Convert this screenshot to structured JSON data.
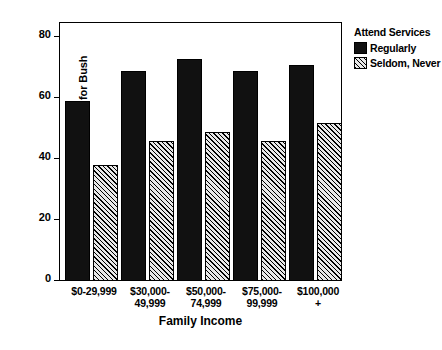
{
  "chart_data": {
    "type": "bar",
    "title": "",
    "xlabel": "Family Income",
    "ylabel": "% Voting for Bush",
    "ylim": [
      0,
      85
    ],
    "yticks": [
      0,
      20,
      40,
      60,
      80
    ],
    "ytick_labels": [
      "0",
      "20",
      "40",
      "60",
      "80"
    ],
    "grid": false,
    "legend_position": "right-top",
    "legend_title": "Attend Services",
    "categories": [
      "$0-29,999",
      "$30,000-\n49,999",
      "$50,000-\n74,999",
      "$75,000-\n99,999",
      "$100,000\n+"
    ],
    "series": [
      {
        "name": "Regularly",
        "fill": "solid-black",
        "color": "#111111",
        "values": [
          59,
          69,
          73,
          69,
          71
        ]
      },
      {
        "name": "Seldom, Never",
        "fill": "diagonal-hatch",
        "color": "#e8e8e8",
        "values": [
          38,
          46,
          49,
          46,
          52
        ]
      }
    ]
  },
  "axes": {
    "y_label": "% Voting for Bush",
    "x_label": "Family Income",
    "y_tick_0": "0",
    "y_tick_1": "20",
    "y_tick_2": "40",
    "y_tick_3": "60",
    "y_tick_4": "80",
    "x_cat_0_line_1": "$0-29,999",
    "x_cat_0_line_2": "",
    "x_cat_1_line_1": "$30,000-",
    "x_cat_1_line_2": "49,999",
    "x_cat_2_line_1": "$50,000-",
    "x_cat_2_line_2": "74,999",
    "x_cat_3_line_1": "$75,000-",
    "x_cat_3_line_2": "99,999",
    "x_cat_4_line_1": "$100,000",
    "x_cat_4_line_2": "+"
  },
  "legend": {
    "title": "Attend Services",
    "item_0_label": "Regularly",
    "item_1_label": "Seldom, Never"
  }
}
